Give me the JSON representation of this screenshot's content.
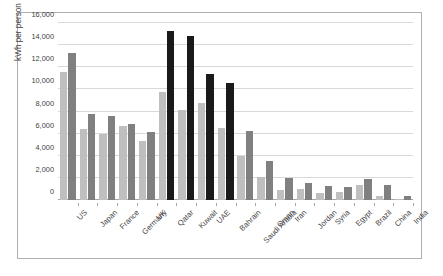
{
  "chart_data": {
    "type": "bar",
    "title": "",
    "xlabel": "",
    "ylabel": "kWh per person",
    "ylim": [
      0,
      16000
    ],
    "yticks": [
      "0",
      "2,000",
      "4,000",
      "6,000",
      "8,000",
      "10,000",
      "12,000",
      "14,000",
      "16,000"
    ],
    "ytick_values": [
      0,
      2000,
      4000,
      6000,
      8000,
      10000,
      12000,
      14000,
      16000
    ],
    "grid": true,
    "legend": "none",
    "categories": [
      "US",
      "Japan",
      "France",
      "Germany",
      "UK",
      "Qatar",
      "Kuwait",
      "UAE",
      "Bahrain",
      "Saudi Arabia",
      "Oman",
      "Iran",
      "Jordan",
      "Syria",
      "Egypt",
      "Brazil",
      "China",
      "India"
    ],
    "series": [
      {
        "name": "series-1",
        "color": "#bfbfbf",
        "values": [
          11600,
          6450,
          6000,
          6650,
          5350,
          9800,
          8100,
          8750,
          6550,
          4000,
          2100,
          950,
          1000,
          600,
          700,
          1330,
          400,
          80
        ]
      },
      {
        "name": "series-2",
        "color": "#808080",
        "values": [
          13250,
          7800,
          7550,
          6900,
          6150,
          15300,
          14850,
          11400,
          10550,
          6250,
          3500,
          1950,
          1500,
          1250,
          1180,
          1880,
          1350,
          400
        ]
      }
    ],
    "highlighted_categories": [
      "Qatar",
      "Kuwait",
      "UAE",
      "Bahrain"
    ],
    "highlight_color": "#1a1a1a"
  },
  "frame": {
    "border_color": "#b0b0b0",
    "background": "#ffffff"
  }
}
